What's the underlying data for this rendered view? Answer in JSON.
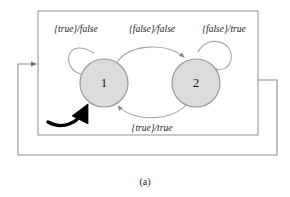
{
  "figure": {
    "caption": "(a)",
    "colors": {
      "state_fill": "#dcdcdc",
      "state_stroke": "#9a9a9a",
      "edge_stroke": "#9a9a9a",
      "box_stroke": "#9a9a9a",
      "outer_loop_stroke": "#8f8f8f",
      "initial_arrow": "#000000",
      "text": "#1a1a1a",
      "background": "#ffffff"
    }
  },
  "states": [
    {
      "id": "1",
      "label": "1"
    },
    {
      "id": "2",
      "label": "2"
    }
  ],
  "transitions": [
    {
      "id": "self-loop-1",
      "from": "1",
      "to": "1",
      "guard": "{true}",
      "separator": "/",
      "output": "false",
      "label": "{true}/false"
    },
    {
      "id": "one-to-two",
      "from": "1",
      "to": "2",
      "guard": "{false}",
      "separator": "/",
      "output": "false",
      "label": "{false}/false"
    },
    {
      "id": "self-loop-2",
      "from": "2",
      "to": "2",
      "guard": "{false}",
      "separator": "/",
      "output": "true",
      "label": "{false}/true"
    },
    {
      "id": "two-to-one",
      "from": "2",
      "to": "1",
      "guard": "{true}",
      "separator": "/",
      "output": "true",
      "label": "{true}/true"
    }
  ],
  "initial_state": "1"
}
